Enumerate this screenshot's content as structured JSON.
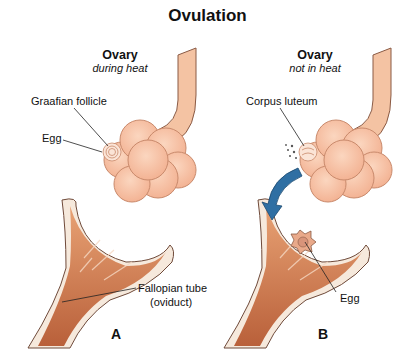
{
  "title": "Ovulation",
  "panels": {
    "a": {
      "letter": "A",
      "header": "Ovary",
      "subheader": "during heat",
      "labels": {
        "follicle": "Graafian follicle",
        "egg": "Egg",
        "tube_line1": "Fallopian tube",
        "tube_line2": "(oviduct)"
      }
    },
    "b": {
      "letter": "B",
      "header": "Ovary",
      "subheader": "not in heat",
      "labels": {
        "corpus": "Corpus luteum",
        "egg": "Egg"
      }
    }
  },
  "colors": {
    "ovary": "#f7c4a5",
    "ovary_outline": "#c98a6c",
    "tube": "#d9875a",
    "tube_dark": "#b9603a",
    "tube_rim": "#f6e9dc",
    "arrow": "#2f6fa3"
  }
}
